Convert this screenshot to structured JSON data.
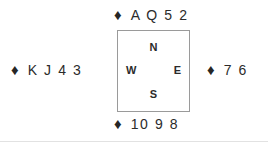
{
  "diagram": {
    "type": "bridge-hand-diagram",
    "suit_symbol": "♦",
    "suit_name": "diamonds",
    "suit_color": "#262626",
    "background_color": "#ffffff",
    "box_border_color": "#9a9a9a",
    "text_color": "#2b2b2b"
  },
  "compass": {
    "north": "N",
    "west": "W",
    "east": "E",
    "south": "S"
  },
  "hands": {
    "north": {
      "suit": "♦",
      "ranks": "A Q 5 2"
    },
    "west": {
      "suit": "♦",
      "ranks": "K J 4 3"
    },
    "east": {
      "suit": "♦",
      "ranks": "7 6"
    },
    "south": {
      "suit": "♦",
      "ranks": "10 9 8"
    }
  }
}
